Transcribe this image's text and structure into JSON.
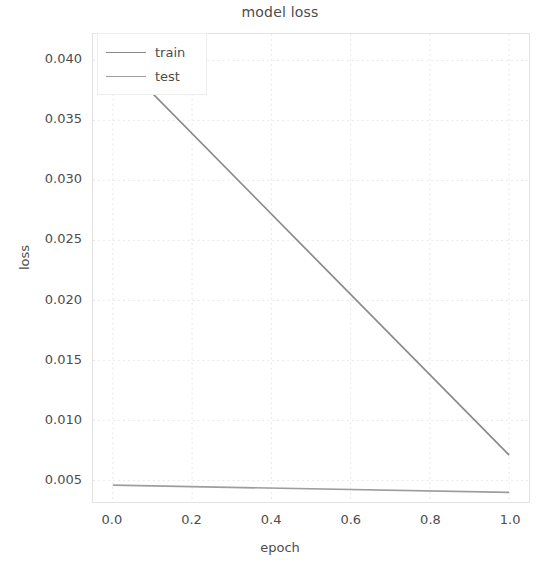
{
  "chart_data": {
    "type": "line",
    "title": "model loss",
    "xlabel": "epoch",
    "ylabel": "loss",
    "xlim": [
      -0.05,
      1.05
    ],
    "ylim": [
      0.0032,
      0.0422
    ],
    "xticks": [
      "0.0",
      "0.2",
      "0.4",
      "0.6",
      "0.8",
      "1.0"
    ],
    "xtick_values": [
      0.0,
      0.2,
      0.4,
      0.6,
      0.8,
      1.0
    ],
    "yticks": [
      "0.005",
      "0.010",
      "0.015",
      "0.020",
      "0.025",
      "0.030",
      "0.035",
      "0.040"
    ],
    "ytick_values": [
      0.005,
      0.01,
      0.015,
      0.02,
      0.025,
      0.03,
      0.035,
      0.04
    ],
    "grid": true,
    "legend_position": "upper left",
    "x": [
      0.0,
      1.0
    ],
    "series": [
      {
        "name": "train",
        "color": "#8a8a8a",
        "values": [
          0.0406,
          0.0071
        ]
      },
      {
        "name": "test",
        "color": "#9d9d9d",
        "values": [
          0.0046,
          0.004
        ]
      }
    ]
  },
  "legend": {
    "items": [
      {
        "label": "train"
      },
      {
        "label": "test"
      }
    ]
  },
  "colors": {
    "train_line": "#8a8a8a",
    "test_line": "#9d9d9d",
    "grid": "#e8e8e8",
    "axis_frame": "#e2e2e2",
    "text": "#4d4d4d",
    "background": "#ffffff"
  }
}
